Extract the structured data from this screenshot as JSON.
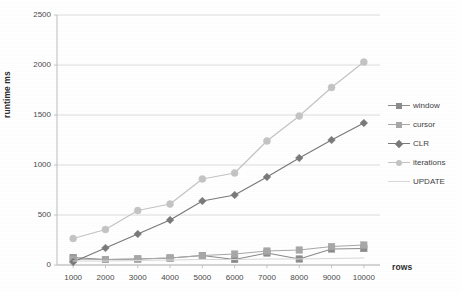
{
  "chart_data": {
    "type": "line",
    "title": "",
    "xlabel": "rows",
    "ylabel": "runtime ms",
    "categories": [
      1000,
      2000,
      3000,
      4000,
      5000,
      6000,
      7000,
      8000,
      9000,
      10000
    ],
    "xtick_labels": [
      "1000",
      "2000",
      "3000",
      "4000",
      "5000",
      "6000",
      "7000",
      "8000",
      "9000",
      "10000"
    ],
    "ytick_labels": [
      "0",
      "500",
      "1000",
      "1500",
      "2000",
      "2500"
    ],
    "yticks": [
      0,
      500,
      1000,
      1500,
      2000,
      2500
    ],
    "ylim": [
      0,
      2500
    ],
    "grid": true,
    "legend_position": "right",
    "series": [
      {
        "name": "window",
        "color": "#8c8c8c",
        "marker": "square",
        "values": [
          75,
          55,
          60,
          70,
          95,
          55,
          120,
          60,
          160,
          165
        ]
      },
      {
        "name": "cursor",
        "color": "#a8a8a8",
        "marker": "square",
        "values": [
          60,
          55,
          60,
          70,
          95,
          110,
          140,
          150,
          185,
          200
        ]
      },
      {
        "name": "CLR",
        "color": "#7a7a7a",
        "marker": "diamond",
        "values": [
          30,
          170,
          310,
          450,
          640,
          700,
          880,
          1070,
          1250,
          1420
        ]
      },
      {
        "name": "iterations",
        "color": "#c4c4c4",
        "marker": "circle",
        "values": [
          265,
          355,
          545,
          610,
          860,
          920,
          1240,
          1490,
          1775,
          2030
        ]
      },
      {
        "name": "UPDATE",
        "color": "#d8d8d8",
        "marker": "line",
        "values": [
          40,
          40,
          45,
          50,
          55,
          55,
          60,
          60,
          65,
          70
        ]
      }
    ],
    "colors": {
      "plot_background": "#ffffff",
      "gridline": "#d9d9d9",
      "axis": "#bdbdbd",
      "text": "#3a3a3a"
    }
  }
}
